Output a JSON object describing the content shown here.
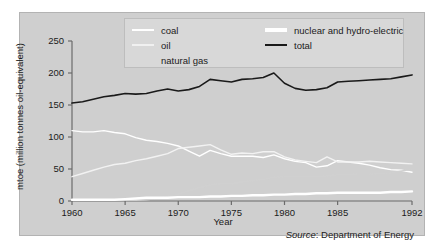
{
  "chart_data": {
    "type": "line",
    "title": "",
    "xlabel": "Year",
    "ylabel": "mtoe (million tonnes oil-equivalent)",
    "xlim": [
      1960,
      1992
    ],
    "ylim": [
      0,
      250
    ],
    "yticks": [
      0,
      50,
      100,
      150,
      200,
      250
    ],
    "xticks": [
      1960,
      1965,
      1970,
      1975,
      1980,
      1985,
      1992
    ],
    "grid": false,
    "legend_position": "top-center",
    "x": [
      1960,
      1961,
      1962,
      1963,
      1964,
      1965,
      1966,
      1967,
      1968,
      1969,
      1970,
      1971,
      1972,
      1973,
      1974,
      1975,
      1976,
      1977,
      1978,
      1979,
      1980,
      1981,
      1982,
      1983,
      1984,
      1985,
      1986,
      1987,
      1988,
      1989,
      1990,
      1991,
      1992
    ],
    "series": [
      {
        "name": "coal",
        "color": "#ffffff",
        "values": [
          110,
          108,
          108,
          110,
          107,
          105,
          99,
          95,
          93,
          90,
          86,
          78,
          70,
          79,
          74,
          70,
          70,
          70,
          68,
          72,
          66,
          62,
          60,
          53,
          55,
          63,
          61,
          59,
          56,
          52,
          49,
          48,
          45
        ]
      },
      {
        "name": "oil",
        "color": "#f2f2f2",
        "values": [
          38,
          43,
          48,
          53,
          57,
          59,
          63,
          66,
          70,
          74,
          82,
          84,
          86,
          88,
          80,
          73,
          75,
          74,
          77,
          77,
          69,
          64,
          62,
          60,
          69,
          61,
          61,
          61,
          62,
          61,
          60,
          59,
          58
        ]
      },
      {
        "name": "natural gas",
        "color": "#d0d0d0",
        "values": [
          1,
          1,
          1,
          1,
          1,
          1,
          1,
          2,
          4,
          7,
          11,
          16,
          21,
          25,
          27,
          27,
          30,
          32,
          34,
          37,
          38,
          38,
          38,
          38,
          39,
          41,
          41,
          42,
          42,
          43,
          44,
          47,
          49
        ]
      },
      {
        "name": "nuclear and hydro-electric",
        "color": "#ffffff",
        "values": [
          2,
          2,
          2,
          2,
          2,
          3,
          4,
          5,
          5,
          5,
          6,
          6,
          6,
          7,
          7,
          8,
          8,
          9,
          9,
          10,
          10,
          11,
          11,
          12,
          12,
          13,
          13,
          13,
          13,
          13,
          14,
          14,
          15
        ]
      },
      {
        "name": "total",
        "color": "#1a1a1a",
        "values": [
          153,
          155,
          159,
          163,
          165,
          168,
          167,
          168,
          172,
          175,
          172,
          174,
          179,
          190,
          188,
          186,
          190,
          191,
          193,
          200,
          184,
          176,
          173,
          174,
          177,
          186,
          187,
          188,
          189,
          190,
          191,
          194,
          197
        ]
      }
    ]
  },
  "legend": {
    "items": [
      {
        "label": "coal",
        "swatch": "coal-line-swatch"
      },
      {
        "label": "oil",
        "swatch": "oil-line-swatch"
      },
      {
        "label": "natural gas",
        "swatch": "natural-gas-line-swatch"
      },
      {
        "label": "nuclear and hydro-electric",
        "swatch": "nuclear-line-swatch"
      },
      {
        "label": "total",
        "swatch": "total-line-swatch"
      }
    ]
  },
  "axes": {
    "y_title": "mtoe (million tonnes oil-equivalent)",
    "x_title": "Year",
    "y_ticks": [
      "250",
      "200",
      "150",
      "100",
      "50",
      "0"
    ],
    "x_ticks": [
      "1960",
      "1965",
      "1970",
      "1975",
      "1980",
      "1985",
      "1992"
    ]
  },
  "source": {
    "label": "Source",
    "separator": ": ",
    "value": "Department of Energy"
  },
  "colors": {
    "panel_background": "#cfcfcf",
    "legend_background": "#d8d8d8",
    "axis": "#6b6b6b",
    "text": "#1b1b1b",
    "total_line": "#1a1a1a"
  }
}
